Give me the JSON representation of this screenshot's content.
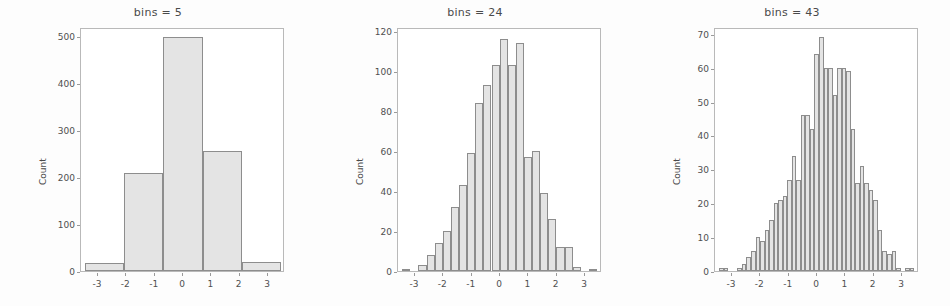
{
  "figure": {
    "width": 950,
    "height": 306,
    "background_color": "#fdfdfd",
    "bar_fill_color": "#e4e4e4",
    "bar_edge_color": "#8d8d8d",
    "axis_color": "#b9b9b9",
    "text_color": "#4a4a4a"
  },
  "chart_data": [
    {
      "type": "bar",
      "title": "bins = 5",
      "xlabel": "",
      "ylabel": "Count",
      "xlim": [
        -3.6,
        3.6
      ],
      "ylim": [
        0,
        520
      ],
      "grid": false,
      "legend": "none",
      "xticks": [
        -3,
        -2,
        -1,
        0,
        1,
        2,
        3
      ],
      "xtick_labels": [
        "-3",
        "-2",
        "-1",
        "0",
        "1",
        "2",
        "3"
      ],
      "yticks": [
        0,
        100,
        200,
        300,
        400,
        500
      ],
      "ytick_labels": [
        "0",
        "100",
        "200",
        "300",
        "400",
        "500"
      ],
      "bin_edges": [
        -3.45,
        -2.07,
        -0.69,
        0.69,
        2.07,
        3.45
      ],
      "values": [
        18,
        208,
        499,
        256,
        19
      ]
    },
    {
      "type": "bar",
      "title": "bins = 24",
      "xlabel": "",
      "ylabel": "Count",
      "xlim": [
        -3.6,
        3.6
      ],
      "ylim": [
        0,
        122
      ],
      "grid": false,
      "legend": "none",
      "xticks": [
        -3,
        -2,
        -1,
        0,
        1,
        2,
        3
      ],
      "xtick_labels": [
        "-3",
        "-2",
        "-1",
        "0",
        "1",
        "2",
        "3"
      ],
      "yticks": [
        0,
        20,
        40,
        60,
        80,
        100,
        120
      ],
      "ytick_labels": [
        "0",
        "20",
        "40",
        "60",
        "80",
        "100",
        "120"
      ],
      "bin_edges": [
        -3.45,
        -3.16,
        -2.88,
        -2.59,
        -2.3,
        -2.02,
        -1.73,
        -1.44,
        -1.16,
        -0.87,
        -0.59,
        -0.3,
        -0.01,
        0.27,
        0.56,
        0.85,
        1.13,
        1.42,
        1.7,
        1.99,
        2.28,
        2.56,
        2.85,
        3.14,
        3.42
      ],
      "values": [
        1,
        0,
        3,
        8,
        14,
        20,
        32,
        43,
        59,
        84,
        93,
        103,
        116,
        103,
        114,
        57,
        60,
        39,
        26,
        12,
        12,
        2,
        0,
        1
      ]
    },
    {
      "type": "bar",
      "title": "bins = 43",
      "xlabel": "",
      "ylabel": "Count",
      "xlim": [
        -3.6,
        3.6
      ],
      "ylim": [
        0,
        72
      ],
      "grid": false,
      "legend": "none",
      "xticks": [
        -3,
        -2,
        -1,
        0,
        1,
        2,
        3
      ],
      "xtick_labels": [
        "-3",
        "-2",
        "-1",
        "0",
        "1",
        "2",
        "3"
      ],
      "yticks": [
        0,
        10,
        20,
        30,
        40,
        50,
        60,
        70
      ],
      "ytick_labels": [
        "0",
        "10",
        "20",
        "30",
        "40",
        "50",
        "60",
        "70"
      ],
      "bin_edges": [
        -3.45,
        -3.29,
        -3.13,
        -2.97,
        -2.81,
        -2.65,
        -2.49,
        -2.33,
        -2.17,
        -2.01,
        -1.85,
        -1.69,
        -1.53,
        -1.37,
        -1.21,
        -1.05,
        -0.89,
        -0.73,
        -0.57,
        -0.41,
        -0.25,
        -0.09,
        0.07,
        0.23,
        0.39,
        0.55,
        0.71,
        0.87,
        1.03,
        1.19,
        1.35,
        1.51,
        1.67,
        1.83,
        1.99,
        2.15,
        2.31,
        2.47,
        2.63,
        2.79,
        2.95,
        3.11,
        3.27,
        3.43
      ],
      "values": [
        1,
        1,
        0,
        0,
        1,
        2,
        4,
        6,
        10,
        9,
        12,
        15,
        20,
        21,
        22,
        27,
        34,
        27,
        46,
        46,
        42,
        64,
        69,
        60,
        60,
        52,
        60,
        60,
        59,
        42,
        26,
        31,
        26,
        24,
        21,
        12,
        6,
        5,
        6,
        1,
        0,
        1,
        1
      ]
    }
  ]
}
